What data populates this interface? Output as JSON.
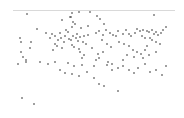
{
  "chart_data": {
    "type": "scatter",
    "title": "",
    "xlabel": "",
    "ylabel": "",
    "grid": false,
    "legend": null,
    "coordinate_space": "image-pixels (x: 0-184 left→right, y: 0-118 top→bottom)",
    "reference_line": {
      "y": 10.5,
      "x_start": 13,
      "x_end": 175,
      "color": "#d9d9d9"
    },
    "point_color": "#3a3a3a",
    "points": [
      [
        27,
        14
      ],
      [
        72,
        13
      ],
      [
        70,
        17
      ],
      [
        71,
        17
      ],
      [
        79,
        12
      ],
      [
        154,
        15
      ],
      [
        62,
        20
      ],
      [
        73,
        22
      ],
      [
        75,
        24
      ],
      [
        72,
        27
      ],
      [
        81,
        28
      ],
      [
        66,
        30
      ],
      [
        68,
        32
      ],
      [
        60,
        33
      ],
      [
        77,
        34
      ],
      [
        84,
        36
      ],
      [
        80,
        37
      ],
      [
        88,
        35
      ],
      [
        37,
        29
      ],
      [
        46,
        33
      ],
      [
        52,
        34
      ],
      [
        55,
        36
      ],
      [
        50,
        38
      ],
      [
        58,
        40
      ],
      [
        61,
        38
      ],
      [
        64,
        42
      ],
      [
        55,
        44
      ],
      [
        57,
        46
      ],
      [
        62,
        48
      ],
      [
        53,
        50
      ],
      [
        20,
        38
      ],
      [
        21,
        42
      ],
      [
        31,
        42
      ],
      [
        21,
        52
      ],
      [
        23,
        57
      ],
      [
        26,
        60
      ],
      [
        18,
        64
      ],
      [
        30,
        48
      ],
      [
        26,
        62
      ],
      [
        65,
        36
      ],
      [
        69,
        39
      ],
      [
        71,
        40
      ],
      [
        73,
        36
      ],
      [
        76,
        38
      ],
      [
        78,
        41
      ],
      [
        83,
        42
      ],
      [
        86,
        44
      ],
      [
        72,
        45
      ],
      [
        74,
        47
      ],
      [
        79,
        49
      ],
      [
        80,
        52
      ],
      [
        84,
        55
      ],
      [
        82,
        58
      ],
      [
        96,
        33
      ],
      [
        99,
        31
      ],
      [
        103,
        35
      ],
      [
        106,
        30
      ],
      [
        110,
        33
      ],
      [
        113,
        35
      ],
      [
        116,
        36
      ],
      [
        118,
        31
      ],
      [
        123,
        34
      ],
      [
        126,
        30
      ],
      [
        129,
        34
      ],
      [
        131,
        36
      ],
      [
        135,
        33
      ],
      [
        137,
        29
      ],
      [
        140,
        31
      ],
      [
        143,
        30
      ],
      [
        147,
        31
      ],
      [
        149,
        32
      ],
      [
        152,
        30
      ],
      [
        154,
        34
      ],
      [
        156,
        32
      ],
      [
        158,
        35
      ],
      [
        161,
        33
      ],
      [
        163,
        30
      ],
      [
        166,
        27
      ],
      [
        142,
        36
      ],
      [
        145,
        38
      ],
      [
        150,
        38
      ],
      [
        152,
        40
      ],
      [
        156,
        42
      ],
      [
        160,
        44
      ],
      [
        147,
        46
      ],
      [
        145,
        50
      ],
      [
        141,
        54
      ],
      [
        156,
        52
      ],
      [
        149,
        55
      ],
      [
        143,
        58
      ],
      [
        119,
        42
      ],
      [
        124,
        44
      ],
      [
        129,
        46
      ],
      [
        133,
        50
      ],
      [
        137,
        52
      ],
      [
        127,
        55
      ],
      [
        134,
        57
      ],
      [
        123,
        60
      ],
      [
        102,
        40
      ],
      [
        107,
        44
      ],
      [
        111,
        47
      ],
      [
        103,
        52
      ],
      [
        99,
        58
      ],
      [
        108,
        62
      ],
      [
        94,
        66
      ],
      [
        112,
        64
      ],
      [
        90,
        12
      ],
      [
        97,
        16
      ],
      [
        100,
        19
      ],
      [
        104,
        24
      ],
      [
        88,
        26
      ],
      [
        92,
        48
      ],
      [
        98,
        54
      ],
      [
        96,
        60
      ],
      [
        40,
        62
      ],
      [
        48,
        64
      ],
      [
        55,
        62
      ],
      [
        68,
        63
      ],
      [
        74,
        66
      ],
      [
        82,
        65
      ],
      [
        60,
        70
      ],
      [
        65,
        73
      ],
      [
        72,
        74
      ],
      [
        79,
        76
      ],
      [
        87,
        72
      ],
      [
        94,
        78
      ],
      [
        107,
        65
      ],
      [
        112,
        70
      ],
      [
        118,
        68
      ],
      [
        123,
        66
      ],
      [
        129,
        70
      ],
      [
        134,
        73
      ],
      [
        138,
        68
      ],
      [
        145,
        64
      ],
      [
        150,
        72
      ],
      [
        156,
        70
      ],
      [
        162,
        75
      ],
      [
        166,
        66
      ],
      [
        99,
        84
      ],
      [
        104,
        86
      ],
      [
        118,
        91
      ],
      [
        22,
        98
      ],
      [
        34,
        104
      ]
    ]
  }
}
